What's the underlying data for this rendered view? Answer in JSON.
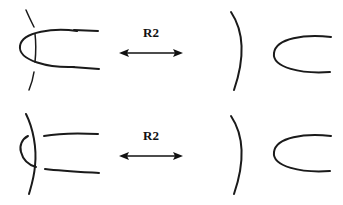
{
  "figure": {
    "domain": "knot-theory-diagram",
    "background_color": "#ffffff",
    "stroke_color": "#1a1a1a",
    "label_color": "#111111",
    "canvas": {
      "width": 343,
      "height": 205
    },
    "rows": [
      {
        "id": "row-top",
        "label": "R2",
        "left_panel": {
          "description": "U-shaped strand opening right crossing over a vertical arc; vertical arc is broken at both crossings (overstrand is the U)",
          "crossing_type": "u-over-arc",
          "broken_strand": "vertical-arc"
        },
        "right_panel": {
          "description": "Separated vertical arc and U-shaped strand, no crossings",
          "crossing_type": "none",
          "broken_strand": "none"
        },
        "arrow": {
          "type": "double-headed",
          "direction": "bidirectional",
          "label": "R2"
        }
      },
      {
        "id": "row-bottom",
        "label": "R2",
        "left_panel": {
          "description": "U-shaped strand opening right passing under a vertical arc; both U strands are broken at the crossings (overstrand is the arc)",
          "crossing_type": "arc-over-u",
          "broken_strand": "u-strands"
        },
        "right_panel": {
          "description": "Separated vertical arc and U-shaped strand, no crossings",
          "crossing_type": "none",
          "broken_strand": "none"
        },
        "arrow": {
          "type": "double-headed",
          "direction": "bidirectional",
          "label": "R2"
        }
      }
    ]
  }
}
